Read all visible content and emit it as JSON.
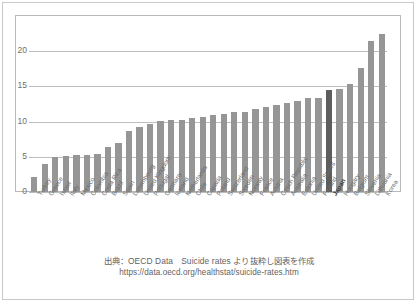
{
  "footer": {
    "source_label": "出典：OECD Data　Suicide rates より抜粋し図表を作成",
    "url": "https://data.oecd.org/healthstat/suicide-rates.htm"
  },
  "styles": {
    "bar_color": "#969696",
    "highlight_color": "#5d5d5d",
    "gridline_color": "#bdbdbd",
    "tick_text_color": "#6e6e6e",
    "plot_background": "#ffffff",
    "frame_border": "#b9b9b9"
  },
  "chart_data": {
    "type": "bar",
    "title": "",
    "subtitle": "",
    "xlabel": "",
    "ylabel": "",
    "ylim": [
      0,
      25
    ],
    "yticks": [
      0,
      5,
      10,
      15,
      20
    ],
    "ytick_labels": [
      "0",
      "5",
      "10",
      "15",
      "20"
    ],
    "grid": true,
    "legend": false,
    "orientation": "vertical",
    "sorted": "ascending",
    "highlight_category": "Japan",
    "units": "deaths per 100 000 population",
    "categories": [
      "Turkey",
      "Greece",
      "Israel",
      "Italy",
      "Mexico",
      "Colombia",
      "Costa Rica",
      "Brazil",
      "Spain",
      "Luxembourg",
      "United Kingdom",
      "Portugal",
      "Germany",
      "Iceland",
      "Netherlands",
      "Chile",
      "Canada",
      "Poland",
      "Switzerland",
      "Sweden",
      "Norway",
      "France",
      "Austria",
      "Czech Republic",
      "Australia",
      "Estonia",
      "United States",
      "Finland",
      "Japan",
      "Hungary",
      "Belgium",
      "Slovenia",
      "Lithuania",
      "Korea"
    ],
    "values": [
      2.1,
      4.0,
      5.0,
      5.1,
      5.2,
      5.3,
      5.4,
      6.4,
      7.0,
      8.7,
      9.3,
      9.6,
      10.1,
      10.2,
      10.3,
      10.5,
      10.7,
      11.0,
      11.1,
      11.3,
      11.4,
      11.8,
      12.1,
      12.4,
      12.6,
      12.9,
      13.3,
      13.4,
      14.5,
      14.7,
      15.3,
      17.6,
      21.5,
      22.5
    ]
  }
}
